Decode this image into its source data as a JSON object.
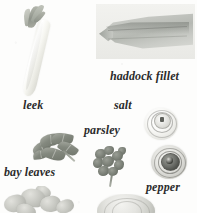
{
  "page": {
    "kind": "ingredient-plate",
    "background_color": "#fdfdfc",
    "caption_color": "#2b2b2b",
    "width": 197,
    "height": 213
  },
  "items": [
    {
      "id": "leek",
      "label": "leek",
      "photo_name": "leek-photograph",
      "description": "pale trimmed leek stalk with grey-green leaves, tilted diagonally"
    },
    {
      "id": "haddock",
      "label": "haddock fillet",
      "photo_name": "haddock-fillet-photograph",
      "description": "grey wedge-shaped white fish fillet on a light rectangular ground"
    },
    {
      "id": "salt",
      "label": "salt",
      "photo_name": "salt-shaker-photograph",
      "description": "pale salt shaker seen from above with circular perforated cap"
    },
    {
      "id": "parsley",
      "label": "parsley",
      "photo_name": "parsley-photograph",
      "description": "small bunch of frilly dark parsley leaves on a stem"
    },
    {
      "id": "bay-leaves",
      "label": "bay leaves",
      "photo_name": "bay-leaves-photograph",
      "description": "sprig of several pointed grey-green bay leaves"
    },
    {
      "id": "pepper",
      "label": "pepper",
      "photo_name": "pepper-grinder-photograph",
      "description": "dark pepper grinder seen from above with concentric rings"
    },
    {
      "id": "potatoes",
      "label": "",
      "photo_name": "potatoes-photograph",
      "description": "cluster of pale potatoes cropped at the bottom edge"
    },
    {
      "id": "onion",
      "label": "",
      "photo_name": "onion-photograph",
      "description": "rounded pale onion cropped at the bottom edge"
    }
  ]
}
